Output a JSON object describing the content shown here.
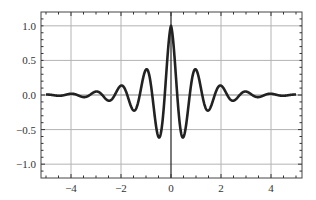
{
  "chart_data": {
    "type": "line",
    "title": "",
    "xlabel": "",
    "ylabel": "",
    "xlim": [
      -5.2,
      5.24
    ],
    "ylim": [
      -1.2,
      1.2
    ],
    "grid": true,
    "legend": null,
    "xticks": [
      -4,
      -2,
      0,
      2,
      4
    ],
    "xtick_labels": [
      "−4",
      "−2",
      "0",
      "2",
      "4"
    ],
    "yticks": [
      1.0,
      0.5,
      0.0,
      -0.5,
      -1.0
    ],
    "ytick_labels": [
      "1.0",
      "0.5",
      "0.0",
      "−0.5",
      "−1.0"
    ],
    "series": [
      {
        "name": "f(x) = e^(-|x|) cos(2πx)",
        "color": "#222222",
        "x": [
          -5,
          -4.5,
          -4,
          -3.5,
          -3,
          -2.5,
          -2,
          -1.5,
          -1,
          -0.5,
          0,
          0.5,
          1,
          1.5,
          2,
          2.5,
          3,
          3.5,
          4,
          4.5,
          5
        ],
        "values": [
          0.007,
          -0.011,
          0.018,
          -0.03,
          0.05,
          -0.082,
          0.135,
          -0.223,
          0.368,
          -0.607,
          1.0,
          -0.607,
          0.368,
          -0.223,
          0.135,
          -0.082,
          0.05,
          -0.03,
          0.018,
          -0.011,
          0.007
        ]
      }
    ],
    "colors": {
      "curve": "#222222",
      "grid": "#b4b4b4",
      "axis": "#222222",
      "frame": "#444444"
    }
  }
}
